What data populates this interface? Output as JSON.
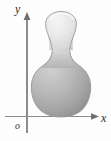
{
  "figure": {
    "background_color": "#fdfdfd",
    "width": 111,
    "height": 141,
    "axes": {
      "x_axis": {
        "label": "x",
        "label_x": 103,
        "label_y": 121,
        "y_position": 116,
        "x_start": 6,
        "x_end": 98,
        "arrow": "right-arrowhead",
        "color": "#8c8c8c"
      },
      "y_axis": {
        "label": "y",
        "label_x": 17,
        "label_y": 12,
        "x_position": 27,
        "y_start": 132,
        "y_end": 15,
        "arrow": "up-arrowhead",
        "color": "#8c8c8c"
      },
      "origin": {
        "label": "o",
        "label_x": 18,
        "label_y": 127
      }
    },
    "region": {
      "name": "gourd-region",
      "description": "large shaded bulb tangent to the x-axis topped by a narrow neck and a smaller lighter bulb",
      "outline_color": "#8f8f8f",
      "lower_bulb": {
        "center_x": 61,
        "center_y": 92,
        "radius_x": 29,
        "radius_y": 26,
        "fill_light": "#c9c9c9",
        "fill_dark": "#8e8e8e"
      },
      "neck": {
        "waist_x": 61,
        "waist_y": 50,
        "half_width": 9
      },
      "upper_bulb": {
        "center_x": 61,
        "center_y": 24,
        "radius_x": 16,
        "radius_y": 13,
        "fill_light": "#f2f2f2",
        "fill_dark": "#d2d2d2"
      }
    }
  }
}
